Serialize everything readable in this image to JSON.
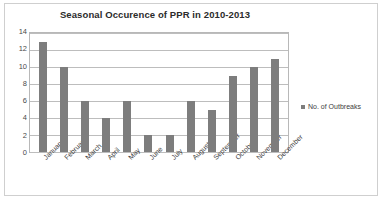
{
  "chart_data": {
    "type": "bar",
    "title": "Seasonal Occurence of PPR in 2010-2013",
    "xlabel": "",
    "ylabel": "",
    "categories": [
      "January",
      "February",
      "March",
      "April",
      "May",
      "June",
      "July",
      "August",
      "September",
      "October",
      "November",
      "December"
    ],
    "series": [
      {
        "name": "No. of Outbreaks",
        "values": [
          13,
          10,
          6,
          4,
          6,
          2,
          2,
          6,
          5,
          9,
          10,
          11
        ]
      }
    ],
    "values": [
      13,
      10,
      6,
      4,
      6,
      2,
      2,
      6,
      5,
      9,
      10,
      11
    ],
    "ylim": [
      0,
      14
    ],
    "ytick_step": 2,
    "yticks": [
      "14",
      "12",
      "10",
      "8",
      "6",
      "4",
      "2",
      "0"
    ],
    "grid": true,
    "legend_position": "right",
    "bar_color": "#7d7d7d",
    "gridline_color": "#bdbdbd",
    "plot_border_color": "#b8b8b8",
    "frame_border_color": "#cfcfcf",
    "background_color": "#ffffff",
    "title_color": "#2b2b2b"
  },
  "legend": {
    "entries": [
      {
        "label": "No. of Outbreaks",
        "marker": "legend-swatch",
        "color": "#7d7d7d"
      }
    ]
  }
}
